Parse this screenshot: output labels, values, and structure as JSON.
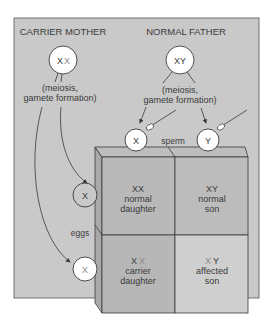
{
  "title_left": "CARRIER MOTHER",
  "title_right": "NORMAL FATHER",
  "mother": {
    "genotype_a": "X",
    "genotype_b": "X"
  },
  "father": {
    "genotype": "XY"
  },
  "meiosis_line1": "(meiosis,",
  "meiosis_line2": "gamete formation)",
  "sperm_label": "sperm",
  "eggs_label": "eggs",
  "sperm": [
    {
      "label": "X"
    },
    {
      "label": "Y"
    }
  ],
  "eggs": [
    {
      "label": "X",
      "mutant": false
    },
    {
      "label": "X",
      "mutant": true
    }
  ],
  "cells": [
    {
      "genotype": "XX",
      "line1": "normal",
      "line2": "daughter"
    },
    {
      "genotype": "XY",
      "line1": "normal",
      "line2": "son"
    },
    {
      "genotype_a": "X",
      "genotype_b": "X",
      "line1": "carrier",
      "line2": "daughter"
    },
    {
      "genotype_a": "X",
      "genotype_b": "Y",
      "line1": "affected",
      "line2": "son"
    }
  ],
  "colors": {
    "panel": "#c9c9c9",
    "cell_dark": "#b8b8b8",
    "cell_light": "#cfcfcf",
    "box_side": "#a9a9a9",
    "box_top": "#bdbdbd",
    "outline": "#3a3a3a",
    "mutant_text": "#8a8a8a",
    "circle_fill": "#ffffff"
  }
}
